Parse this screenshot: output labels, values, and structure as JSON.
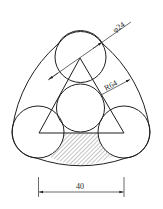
{
  "drawing": {
    "title": "Three tangent circles in rounded triangular outline with inscribed triangle",
    "stroke_color": "#1f1f1f",
    "hatch_color": "#555555",
    "dimensions": {
      "diameter_label": "φ24",
      "radius_label": "R64",
      "width_label": "40"
    },
    "elements": {
      "circles": [
        "top circle",
        "center circle",
        "bottom-left circle",
        "bottom-right circle"
      ],
      "triangle": "equilateral triangle through circle centers",
      "hatched_region": "region below triangle base between lower circles"
    }
  }
}
